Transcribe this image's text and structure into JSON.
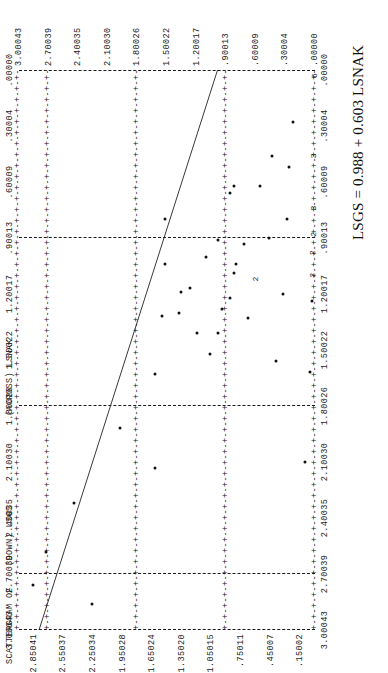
{
  "report": {
    "title_scatter": "SCATTERGRAM OF",
    "title_down": "(DOWN) LSGS",
    "title_across": "(ACROSS) LSNAK",
    "equation": "LSGS = 0.988 + 0.603 LSNAK",
    "axis_rule_glyph": "+-+-+-+-+-+-+-+-+-+-+-+-+-+-+-+-+-+-+-+-+-+-+-+-+-+-+-+-+-+-+-+-+-+-+-+-+-+-+-+-+-+-+-+-+-+-+-+-+-+-+-+-+-+-+-+-+-+-+-+-+-+-+-+-+-+-+-+-+-+-+-+-+-+-+-+-+-+-+-+-+-+-+-+-+-+-+-+-+-+-+-+-+-+-+-+-+-+-+-+-+-+-+-+-+-+-+-+-+-+-+-+-+-+-+-+-+-+-+-+-+-+-+-+-+-+-+-+-+-+-+-+-+-+-+-+-+-+-+-+-+-+-+-+-+"
  },
  "chart_data": {
    "type": "scatter",
    "title": "SCATTERGRAM OF (DOWN) LSGS (ACROSS) LSNAK",
    "xlabel": "LSNAK",
    "ylabel": "LSGS",
    "xlim": [
      0.0,
      3.00043
    ],
    "ylim": [
      0.0,
      3.00043
    ],
    "grid": true,
    "regression_label": "LSGS = 0.988 + 0.603 LSNAK",
    "regression": {
      "intercept": 0.988,
      "slope": 0.603
    },
    "x_major_ticks": [
      "3.00043",
      "2.70039",
      "2.40035",
      "2.10030",
      "1.80026",
      "1.50022",
      "1.20017",
      ".90013",
      ".60009",
      ".30004",
      ".00000"
    ],
    "x_minor_ticks": [
      "2.85041",
      "2.55037",
      "2.25034",
      "1.95028",
      "1.65024",
      "1.35020",
      "1.05015",
      ".75011",
      ".45007",
      ".15002"
    ],
    "y_major_ticks": [
      "3.00043",
      "2.70039",
      "2.40035",
      "2.10030",
      "1.80026",
      "1.50022",
      "1.20017",
      ".90013",
      ".60009",
      ".30004",
      ".00000"
    ],
    "y_minor_ticks": [
      "2.85041",
      "2.55037",
      "2.25034",
      "1.95028",
      "1.65024",
      "1.35020",
      "1.05015",
      ".75011",
      ".45007",
      ".15002"
    ],
    "gridlines_x": [
      0.90013,
      1.80026,
      2.70039
    ],
    "gridlines_y": [
      0.90013,
      1.80026,
      2.70039
    ],
    "points": [
      {
        "x": 2.76,
        "y": 2.86,
        "n": 1
      },
      {
        "x": 2.58,
        "y": 2.73,
        "n": 1
      },
      {
        "x": 2.32,
        "y": 2.44,
        "n": 1
      },
      {
        "x": 2.86,
        "y": 2.26,
        "n": 1
      },
      {
        "x": 1.92,
        "y": 1.98,
        "n": 1
      },
      {
        "x": 1.63,
        "y": 1.62,
        "n": 1
      },
      {
        "x": 2.13,
        "y": 1.62,
        "n": 1
      },
      {
        "x": 1.32,
        "y": 1.55,
        "n": 1
      },
      {
        "x": 1.04,
        "y": 1.52,
        "n": 1
      },
      {
        "x": 0.8,
        "y": 1.52,
        "n": 1
      },
      {
        "x": 1.3,
        "y": 1.38,
        "n": 1
      },
      {
        "x": 1.19,
        "y": 1.36,
        "n": 1
      },
      {
        "x": 1.17,
        "y": 1.27,
        "n": 1
      },
      {
        "x": 1.41,
        "y": 1.2,
        "n": 1
      },
      {
        "x": 1.0,
        "y": 1.1,
        "n": 1
      },
      {
        "x": 1.52,
        "y": 1.06,
        "n": 1
      },
      {
        "x": 0.91,
        "y": 0.98,
        "n": 1
      },
      {
        "x": 1.41,
        "y": 0.98,
        "n": 1
      },
      {
        "x": 1.28,
        "y": 0.94,
        "n": 1
      },
      {
        "x": 1.22,
        "y": 0.86,
        "n": 1
      },
      {
        "x": 1.09,
        "y": 0.82,
        "n": 1
      },
      {
        "x": 1.04,
        "y": 0.8,
        "n": 1
      },
      {
        "x": 0.66,
        "y": 0.86,
        "n": 1
      },
      {
        "x": 0.62,
        "y": 0.82,
        "n": 1
      },
      {
        "x": 0.93,
        "y": 0.72,
        "n": 1
      },
      {
        "x": 1.33,
        "y": 0.68,
        "n": 1
      },
      {
        "x": 1.12,
        "y": 0.6,
        "n": 2
      },
      {
        "x": 0.62,
        "y": 0.56,
        "n": 1
      },
      {
        "x": 0.9,
        "y": 0.47,
        "n": 1
      },
      {
        "x": 0.46,
        "y": 0.44,
        "n": 1
      },
      {
        "x": 1.56,
        "y": 0.4,
        "n": 1
      },
      {
        "x": 1.2,
        "y": 0.32,
        "n": 1
      },
      {
        "x": 0.8,
        "y": 0.28,
        "n": 1
      },
      {
        "x": 0.52,
        "y": 0.26,
        "n": 1
      },
      {
        "x": 0.28,
        "y": 0.22,
        "n": 1
      },
      {
        "x": 2.1,
        "y": 0.1,
        "n": 1
      },
      {
        "x": 1.62,
        "y": 0.05,
        "n": 1
      },
      {
        "x": 1.24,
        "y": 0.03,
        "n": 1
      },
      {
        "x": 1.1,
        "y": 0.02,
        "n": 2
      },
      {
        "x": 0.98,
        "y": 0.02,
        "n": 2
      },
      {
        "x": 0.88,
        "y": 0.01,
        "n": 2
      },
      {
        "x": 0.74,
        "y": 0.01,
        "n": 3
      },
      {
        "x": 0.46,
        "y": 0.01,
        "n": 3
      },
      {
        "x": 0.03,
        "y": 0.0,
        "n": 6
      }
    ]
  }
}
